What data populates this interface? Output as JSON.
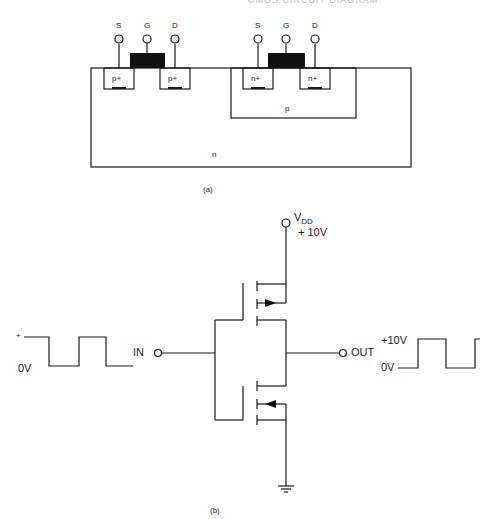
{
  "header": {
    "text": "CMOS CIRCUIT DIAGRAM"
  },
  "figure_a": {
    "caption": "(a)",
    "pmos": {
      "source": "S",
      "gate": "G",
      "drain": "D",
      "left_diffusion": "p+",
      "right_diffusion": "p+"
    },
    "nmos": {
      "source": "S",
      "gate": "G",
      "drain": "D",
      "left_diffusion": "n+",
      "right_diffusion": "n+"
    },
    "p_well": "p",
    "substrate": "n"
  },
  "figure_b": {
    "caption": "(b)",
    "vdd_label": "V",
    "vdd_sub": "DD",
    "vdd_value": "+ 10V",
    "input_label": "IN",
    "output_label": "OUT",
    "input_wave": {
      "high_label": "+",
      "low_label": "0V"
    },
    "output_wave": {
      "high_label": "+10V",
      "low_label": "0V"
    }
  },
  "colors": {
    "line": "#1a1a1a",
    "gate_fill": "#111111",
    "background": "#ffffff"
  }
}
